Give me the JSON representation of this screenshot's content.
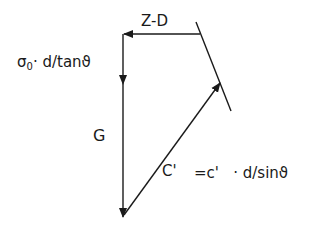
{
  "diagram": {
    "type": "force-polygon",
    "stroke_color": "#1a1a1a",
    "background": "#ffffff",
    "labels": {
      "z_d": "Z-D",
      "sigma_symbol": "σ",
      "sigma_sub": "0",
      "sigma_term": "· d/tanϑ",
      "g": "G",
      "c_prime": "C'",
      "c_equation": "=c'   · d/sinϑ"
    },
    "vectors": [
      {
        "name": "Z-D",
        "from": [
          200,
          34
        ],
        "to": [
          123,
          34
        ]
      },
      {
        "name": "sigma0-d-tan",
        "from": [
          123,
          34
        ],
        "to": [
          123,
          82
        ]
      },
      {
        "name": "G",
        "from": [
          123,
          82
        ],
        "to": [
          123,
          217
        ]
      },
      {
        "name": "C'",
        "from": [
          123,
          217
        ],
        "to": [
          220,
          82
        ]
      }
    ],
    "reference_line": {
      "from": [
        196,
        22
      ],
      "to": [
        231,
        111
      ]
    }
  }
}
